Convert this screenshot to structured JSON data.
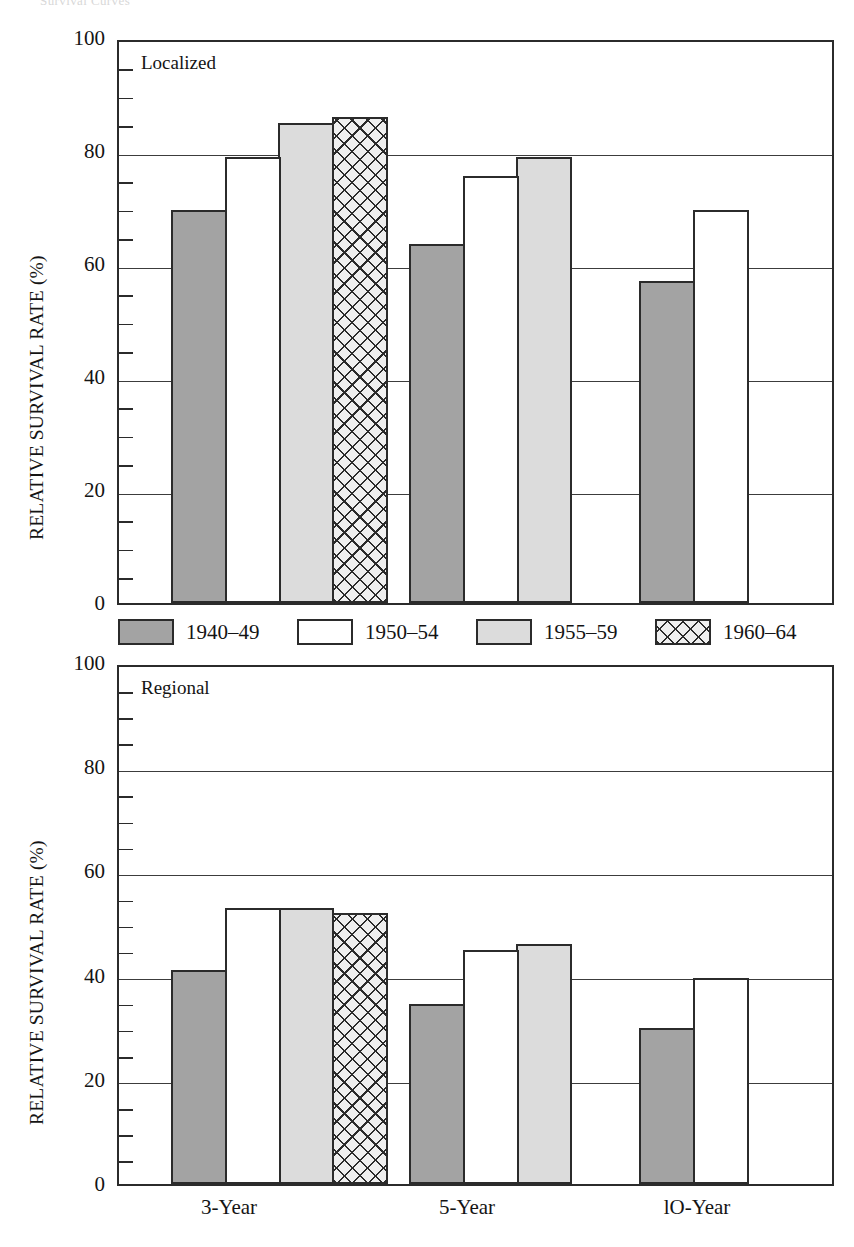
{
  "figure": {
    "cropped_header": "Survival Curves",
    "legend": {
      "items": [
        {
          "label": "1940–49",
          "pattern": "solid-dark-gray",
          "color": "#a3a3a3"
        },
        {
          "label": "1950–54",
          "pattern": "solid-white",
          "color": "#ffffff"
        },
        {
          "label": "1955–59",
          "pattern": "solid-light-gray",
          "color": "#dcdcdc"
        },
        {
          "label": "1960–64",
          "pattern": "crosshatch",
          "color": "#efefef"
        }
      ]
    },
    "ylabel": "RELATIVE SURVIVAL RATE (%)",
    "ytick_labels": [
      "0",
      "20",
      "40",
      "60",
      "80",
      "100"
    ],
    "xtick_labels": [
      "3-Year",
      "5-Year",
      "lO-Year"
    ]
  },
  "chart_data": [
    {
      "type": "bar",
      "title": "Localized",
      "panel": "top",
      "xlabel": "",
      "ylabel": "RELATIVE SURVIVAL RATE (%)",
      "ylim": [
        0,
        100
      ],
      "yticks": [
        0,
        20,
        40,
        60,
        80,
        100
      ],
      "yminor_step": 5,
      "grid": true,
      "categories": [
        "3-Year",
        "5-Year",
        "lO-Year"
      ],
      "legend_position": "below-plot",
      "series": [
        {
          "name": "1940–49",
          "values": [
            69.5,
            63.5,
            57.0
          ]
        },
        {
          "name": "1950–54",
          "values": [
            79.0,
            75.5,
            69.5
          ]
        },
        {
          "name": "1955–59",
          "values": [
            85.0,
            79.0,
            null
          ]
        },
        {
          "name": "1960–64",
          "values": [
            86.0,
            null,
            null
          ]
        }
      ]
    },
    {
      "type": "bar",
      "title": "Regional",
      "panel": "bottom",
      "xlabel": "",
      "ylabel": "RELATIVE SURVIVAL RATE (%)",
      "ylim": [
        0,
        100
      ],
      "yticks": [
        0,
        20,
        40,
        60,
        80,
        100
      ],
      "yminor_step": 5,
      "grid": true,
      "categories": [
        "3-Year",
        "5-Year",
        "lO-Year"
      ],
      "legend_position": "above-plot",
      "series": [
        {
          "name": "1940–49",
          "values": [
            41.0,
            34.5,
            30.0
          ]
        },
        {
          "name": "1950–54",
          "values": [
            53.0,
            45.0,
            39.5
          ]
        },
        {
          "name": "1955–59",
          "values": [
            53.0,
            46.0,
            null
          ]
        },
        {
          "name": "1960–64",
          "values": [
            52.0,
            null,
            null
          ]
        }
      ]
    }
  ]
}
